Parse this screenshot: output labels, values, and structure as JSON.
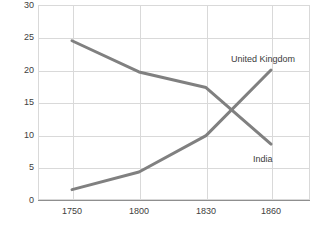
{
  "chart_data": {
    "type": "line",
    "title": "",
    "subtitle": "",
    "xlabel": "",
    "ylabel": "",
    "categories": [
      "1750",
      "1800",
      "1830",
      "1860"
    ],
    "x": [
      1750,
      1800,
      1830,
      1860
    ],
    "series": [
      {
        "name": "United Kingdom",
        "values": [
          24.5,
          19.7,
          17.3,
          8.6
        ],
        "color": "#808080",
        "label_position": "top-right"
      },
      {
        "name": "India",
        "values": [
          1.6,
          4.3,
          9.9,
          20.0
        ],
        "color": "#808080",
        "label_position": "bottom-right"
      }
    ],
    "ylim": [
      0,
      30
    ],
    "yticks": [
      "0",
      "5",
      "10",
      "15",
      "20",
      "25",
      "30"
    ],
    "ytick_values": [
      0,
      5,
      10,
      15,
      20,
      25,
      30
    ],
    "grid": true,
    "grid_axis": "both",
    "legend": "inline-series-labels",
    "background": "#ffffff",
    "grid_color": "#d9d9d9",
    "axis_color": "#8f8f8f",
    "text_color": "#404040"
  },
  "axes": {
    "y_tick_labels": [
      "30",
      "25",
      "20",
      "15",
      "10",
      "5",
      "0"
    ],
    "x_tick_labels": [
      "1750",
      "1800",
      "1830",
      "1860"
    ]
  },
  "annotations": {
    "united_kingdom_label": "United Kingdom",
    "india_label": "India"
  }
}
